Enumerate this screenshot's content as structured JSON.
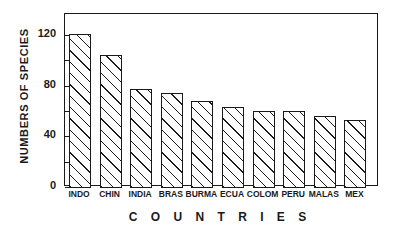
{
  "chart_data": {
    "type": "bar",
    "title": "",
    "xlabel": "C O U N T R I E S",
    "ylabel": "NUMBERS OF SPECIES",
    "categories": [
      "INDO",
      "CHIN",
      "INDIA",
      "BRAS",
      "BURMA",
      "ECUA",
      "COLOM",
      "PERU",
      "MALAS",
      "MEX"
    ],
    "values": [
      121,
      104,
      77,
      74,
      68,
      63,
      60,
      60,
      56,
      53
    ],
    "ylim": [
      0,
      130
    ],
    "ytick_labels": [
      "0",
      "40",
      "80",
      "120"
    ],
    "ytick_values": [
      0,
      40,
      80,
      120
    ],
    "yminor_tick_values": [
      20,
      60,
      100
    ],
    "grid": false,
    "legend": false,
    "bar_fill": "hatched-diagonal",
    "bar_edge_color": "#1a1a1a",
    "axis_color": "#1a1a1a",
    "background_color": "#ffffff"
  },
  "axes": {
    "y_title": "NUMBERS OF SPECIES",
    "x_title": "C O U N T R I E S",
    "ticks": [
      {
        "label": "120",
        "value": 120,
        "kind": "major"
      },
      {
        "label": "",
        "value": 100,
        "kind": "minor"
      },
      {
        "label": "80",
        "value": 80,
        "kind": "major"
      },
      {
        "label": "",
        "value": 60,
        "kind": "minor"
      },
      {
        "label": "40",
        "value": 40,
        "kind": "major"
      },
      {
        "label": "",
        "value": 20,
        "kind": "minor"
      },
      {
        "label": "0",
        "value": 0,
        "kind": "major"
      }
    ]
  }
}
